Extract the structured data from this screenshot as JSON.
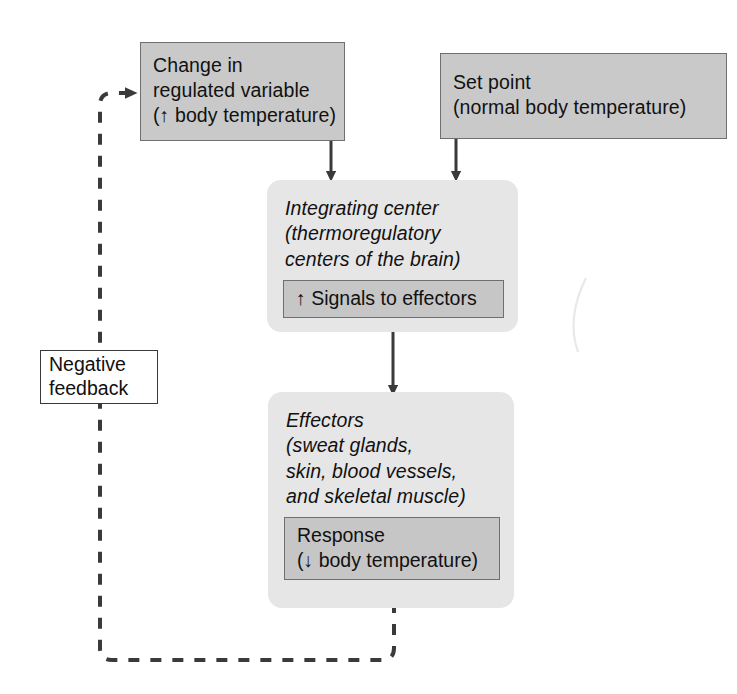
{
  "diagram": {
    "colors": {
      "box_fill": "#c9c9c9",
      "box_border": "#6f6f6f",
      "panel_fill": "#e6e6e6",
      "inner_fill": "#c6c6c6",
      "line": "#3a3a3a",
      "feedback_box_fill": "#ffffff",
      "text": "#111111"
    },
    "nodes": {
      "stimulus": {
        "name": "Change in regulated variable",
        "lines": [
          "Change in",
          "regulated variable"
        ],
        "sub_prefix": "(",
        "sub_arrow": "↑",
        "sub_text": " body temperature)"
      },
      "setpoint": {
        "name": "Set point",
        "lines": [
          "Set point",
          "(normal body temperature)"
        ]
      },
      "integrating_center": {
        "title_lines": [
          "Integrating center",
          "(thermoregulatory",
          "centers of the brain)"
        ],
        "inner": {
          "arrow": "↑",
          "text": " Signals to effectors"
        }
      },
      "effectors": {
        "title_lines": [
          "Effectors",
          "(sweat glands,",
          "skin, blood vessels,",
          "and skeletal muscle)"
        ],
        "inner": {
          "line1": "Response",
          "prefix": "(",
          "arrow": "↓",
          "suffix": " body temperature)"
        }
      },
      "negative_feedback": {
        "lines": [
          "Negative",
          "feedback"
        ]
      }
    },
    "edges": [
      {
        "from": "stimulus",
        "to": "integrating_center",
        "style": "solid",
        "arrow": true
      },
      {
        "from": "setpoint",
        "to": "integrating_center",
        "style": "solid",
        "arrow": true
      },
      {
        "from": "integrating_center",
        "to": "effectors",
        "style": "solid",
        "arrow": true
      },
      {
        "from": "effectors",
        "to": "stimulus",
        "style": "dashed",
        "arrow": true,
        "label": "negative_feedback"
      }
    ]
  }
}
